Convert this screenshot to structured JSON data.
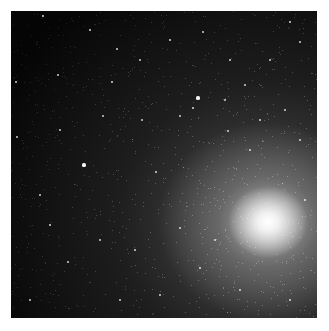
{
  "image": {
    "subject": "galaxy",
    "description": "Grayscale astronomical image of a bright galaxy core in the lower right with a diffuse halo and scattered foreground stars on a black background, framed by a white border",
    "core_position": {
      "x": 268,
      "y": 222
    },
    "colors": {
      "background": "#050505",
      "border": "#ffffff",
      "core": "#ffffff"
    }
  },
  "stars": [
    [
      43,
      16,
      1.2
    ],
    [
      117,
      49,
      1.0
    ],
    [
      203,
      32,
      1.0
    ],
    [
      290,
      22,
      1.2
    ],
    [
      16,
      82,
      1.0
    ],
    [
      58,
      75,
      0.9
    ],
    [
      112,
      82,
      1.2
    ],
    [
      198,
      98,
      1.6
    ],
    [
      193,
      108,
      1.2
    ],
    [
      180,
      116,
      1.0
    ],
    [
      142,
      120,
      1.0
    ],
    [
      103,
      116,
      0.9
    ],
    [
      228,
      131,
      1.0
    ],
    [
      84,
      165,
      1.6
    ],
    [
      156,
      172,
      1.0
    ],
    [
      17,
      137,
      0.9
    ],
    [
      300,
      42,
      1.0
    ],
    [
      270,
      60,
      1.0
    ],
    [
      245,
      85,
      0.9
    ],
    [
      50,
      225,
      1.2
    ],
    [
      68,
      262,
      1.0
    ],
    [
      180,
      228,
      1.0
    ],
    [
      200,
      268,
      1.2
    ],
    [
      240,
      290,
      1.0
    ],
    [
      290,
      300,
      1.0
    ],
    [
      30,
      300,
      0.9
    ],
    [
      120,
      300,
      1.0
    ],
    [
      160,
      295,
      0.9
    ],
    [
      300,
      140,
      1.0
    ],
    [
      285,
      110,
      0.9
    ],
    [
      225,
      100,
      0.9
    ],
    [
      140,
      60,
      0.9
    ],
    [
      60,
      130,
      0.9
    ],
    [
      40,
      195,
      1.0
    ],
    [
      100,
      240,
      0.9
    ],
    [
      135,
      250,
      1.0
    ],
    [
      250,
      150,
      0.9
    ],
    [
      215,
      240,
      1.0
    ],
    [
      305,
      200,
      0.9
    ],
    [
      170,
      40,
      0.8
    ],
    [
      90,
      30,
      0.8
    ],
    [
      230,
      60,
      0.8
    ],
    [
      260,
      120,
      0.8
    ]
  ]
}
